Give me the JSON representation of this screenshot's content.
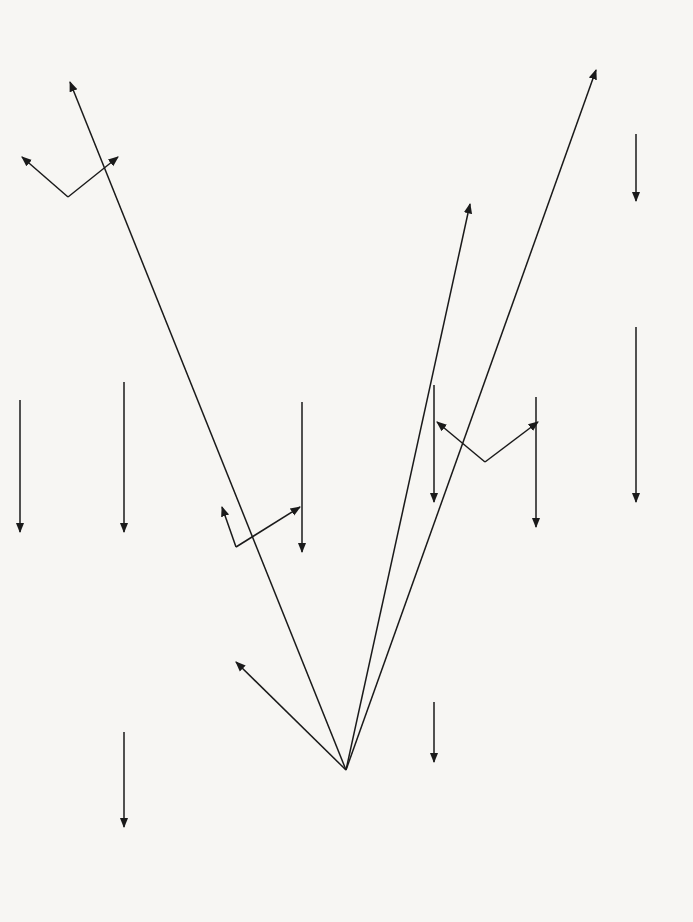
{
  "figure": {
    "number": "FIGURE 35.2",
    "title_lines": [
      "Synthetic Routes from a",
      "Primary Alcohol in Two",
      "Steps or More"
    ]
  },
  "start": {
    "formula": "RCH2CH2OH",
    "label_lines": [
      "Primary",
      "alcohol"
    ]
  },
  "compounds": {
    "alkene": "RCH=CH2",
    "dibromide": "RCH(Br)CH2Br",
    "diol": "RCH(OH)CH2OH",
    "alkyl_hydrogen_sulfate": "RCH(OSO2OH)CH3",
    "secondary_alcohol": "RCH(OH)CH3",
    "ketone": "RCOCH3",
    "alkyl_bromide": "RCH2CH2Br",
    "amine": "RCH2CH2NH2",
    "nitrile_intermediate": "RCH2CH2CN",
    "amine_plus_one": "R(CH2)3NH2",
    "carboxylic_acid": "RCH2CO2H",
    "ammonium_salt": "RCH2CO2NH4",
    "amide": "RCH2CONH2",
    "nitrile": "RCH2CN",
    "chloro_acid": "RCH(Cl)CO2H",
    "hydroxy_acid": "RCH(OH)CO2H",
    "aldehyde": "RCH2CHO",
    "cyanohydrin": "RCH2CH(OH)CN",
    "hydroxy_acid_plus_one": "RCH2CH(OH)CO2H"
  },
  "reagents": {
    "dehydration": "Al2O3, 400 °C",
    "bromination": "Br2",
    "sulfation": "conc. H2SO4",
    "hydrolysis_diol": "OH⁻ (aq)",
    "hydrolysis_sulfate": "H2O, boil.",
    "oxidation_ketone": "Cr2O7²⁻, H⁺",
    "hbr_formation": [
      "KBr +",
      "conc. H2SO4."
    ],
    "amination": [
      "NH3(alc)",
      "heat."
    ],
    "cyanation": "NaCN",
    "reduction": "H2, Ni",
    "oxidation_acid": "Cr2O7²⁻, H⁺, heat.",
    "ammonia": "NH3(aq)",
    "amidation": [
      "xs RCH2CO2H",
      "200 °C"
    ],
    "dehydration_amide": [
      "P2O5",
      "Distil"
    ],
    "chlorination": "Cl2, red P",
    "hydrolysis_chloro": "OH⁻ (aq)",
    "oxidation_aldehyde": "Cr2O7²⁻, H⁺, cold",
    "cyanohydrin_formation": [
      "HCN,",
      "base"
    ],
    "acid_hydrolysis": "H⁺ (aq)"
  },
  "product_labels": {
    "diol_row": [
      "1,2-Dibromoalkane",
      "and",
      "1,2-Diol"
    ],
    "ketone": "Ketone",
    "amine": "Amine",
    "amine_plus_one": [
      "Amine with",
      "one more",
      "carbon atom"
    ],
    "nitrile": "Nitrile",
    "hydroxy_acid": "2-Hydroxycarboxylic acid",
    "hydroxy_acid_plus_one": [
      "2-Hydroxycarboxylic acid",
      "with one more C atom"
    ]
  },
  "colors": {
    "background": "#f7f6f3",
    "reagent_box_fill": "#c9c9c9",
    "line": "#1a1a1a",
    "label_green": "#2e7a2e"
  }
}
